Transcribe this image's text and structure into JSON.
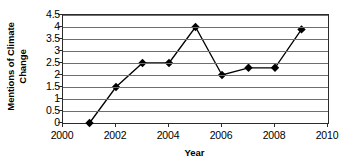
{
  "chart_data": {
    "type": "line",
    "title": "",
    "xlabel": "Year",
    "ylabel_lines": [
      "Mentions of Climate",
      "Change"
    ],
    "ylabel": "Mentions of Climate Change",
    "x": [
      2001,
      2002,
      2003,
      2004,
      2005,
      2006,
      2007,
      2008,
      2009
    ],
    "values": [
      0,
      1.5,
      2.5,
      2.5,
      4,
      2,
      2.3,
      2.3,
      3.9
    ],
    "series": [
      {
        "name": "Mentions of Climate Change",
        "values": [
          0,
          1.5,
          2.5,
          2.5,
          4,
          2,
          2.3,
          2.3,
          3.9
        ]
      }
    ],
    "xlim": [
      2000,
      2010
    ],
    "ylim": [
      0,
      4.5
    ],
    "xticks": [
      2000,
      2002,
      2004,
      2006,
      2008,
      2010
    ],
    "xtick_labels": [
      "2000",
      "2002",
      "2004",
      "2006",
      "2008",
      "2010"
    ],
    "yticks": [
      0,
      0.5,
      1,
      1.5,
      2,
      2.5,
      3,
      3.5,
      4,
      4.5
    ],
    "ytick_labels": [
      "0",
      "0.5",
      "1",
      "1.5",
      "2",
      "2.5",
      "3",
      "3.5",
      "4",
      "4.5"
    ],
    "grid": "horizontal",
    "legend": "none",
    "marker": "diamond",
    "line_color": "#000000",
    "marker_color": "#000000",
    "grid_color": "#6e6e6e",
    "axis_color": "#2b2b2b",
    "background": "#ffffff"
  }
}
